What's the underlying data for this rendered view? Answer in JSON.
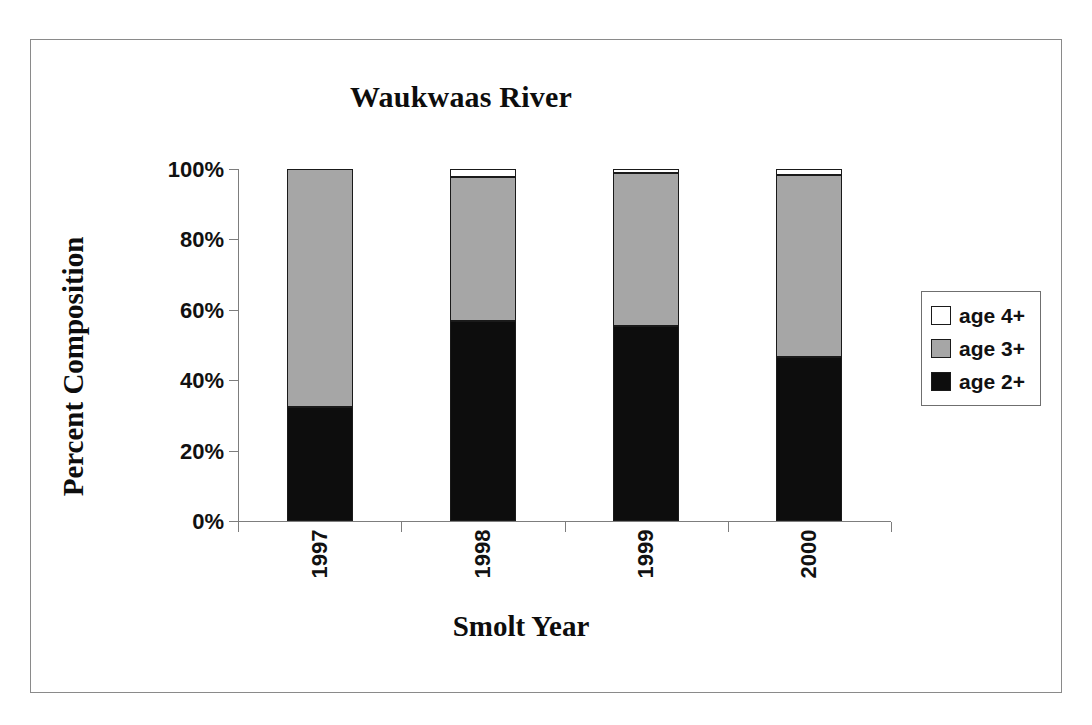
{
  "chart_data": {
    "type": "bar",
    "subtype": "stacked-percent",
    "title": "Waukwaas River",
    "xlabel": "Smolt Year",
    "ylabel": "Percent Composition",
    "categories": [
      "1997",
      "1998",
      "1999",
      "2000"
    ],
    "series": [
      {
        "name": "age 2+",
        "color": "#0d0d0d",
        "values": [
          32.4,
          56.8,
          55.4,
          46.6
        ]
      },
      {
        "name": "age 3+",
        "color": "#a6a6a6",
        "values": [
          67.6,
          40.9,
          43.5,
          51.7
        ]
      },
      {
        "name": "age 4+",
        "color": "#ffffff",
        "values": [
          0.0,
          2.3,
          1.1,
          1.7
        ]
      }
    ],
    "ylim": [
      0,
      100
    ],
    "yticks": [
      "0%",
      "20%",
      "40%",
      "60%",
      "80%",
      "100%"
    ],
    "ytick_values": [
      0,
      20,
      40,
      60,
      80,
      100
    ],
    "grid": false,
    "legend_position": "right",
    "legend_order": [
      "age 4+",
      "age 3+",
      "age 2+"
    ],
    "xtick_rotation": 90
  },
  "legend": {
    "items": [
      {
        "label": "age 4+",
        "swatch": "#ffffff"
      },
      {
        "label": "age 3+",
        "swatch": "#a6a6a6"
      },
      {
        "label": "age 2+",
        "swatch": "#0d0d0d"
      }
    ]
  }
}
